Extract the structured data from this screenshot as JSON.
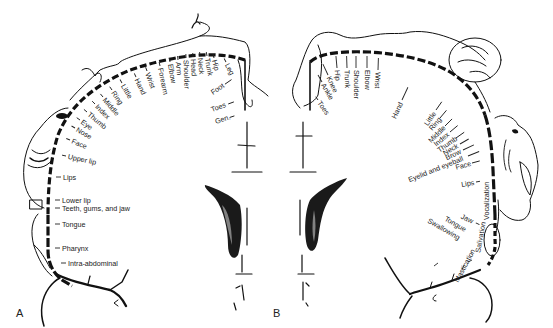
{
  "figure": {
    "panel_a_label": "A",
    "panel_b_label": "B",
    "colors": {
      "ink": "#111111",
      "background": "#ffffff",
      "label_text": "#222222"
    }
  },
  "sensory_homunculus_A": {
    "arc_labels": [
      {
        "text": "Leg"
      },
      {
        "text": "Hip"
      },
      {
        "text": "Trunk"
      },
      {
        "text": "Neck"
      },
      {
        "text": "Head"
      },
      {
        "text": "Shoulder"
      },
      {
        "text": "Arm"
      },
      {
        "text": "Elbow"
      },
      {
        "text": "Forearm"
      },
      {
        "text": "Wrist"
      },
      {
        "text": "Hand"
      },
      {
        "text": "Little"
      },
      {
        "text": "Ring"
      },
      {
        "text": "Middle"
      },
      {
        "text": "Index"
      },
      {
        "text": "Thumb"
      },
      {
        "text": "Eye"
      },
      {
        "text": "Nose"
      },
      {
        "text": "Face"
      },
      {
        "text": "Upper lip"
      }
    ],
    "vertical_labels": [
      {
        "text": "Lips"
      },
      {
        "text": "Lower lip"
      },
      {
        "text": "Teeth, gums, and jaw"
      },
      {
        "text": "Tongue"
      },
      {
        "text": "Pharynx"
      },
      {
        "text": "Intra-abdominal"
      }
    ],
    "medial_labels": [
      {
        "text": "Foot"
      },
      {
        "text": "Toes"
      },
      {
        "text": "Gen."
      }
    ]
  },
  "motor_homunculus_B": {
    "arc_labels": [
      {
        "text": "Toes"
      },
      {
        "text": "Ankle"
      },
      {
        "text": "Knee"
      },
      {
        "text": "Hip"
      },
      {
        "text": "Trunk"
      },
      {
        "text": "Shoulder"
      },
      {
        "text": "Elbow"
      },
      {
        "text": "Wrist"
      },
      {
        "text": "Hand"
      },
      {
        "text": "Little"
      },
      {
        "text": "Ring"
      },
      {
        "text": "Middle"
      },
      {
        "text": "Index"
      },
      {
        "text": "Thumb"
      },
      {
        "text": "Neck"
      },
      {
        "text": "Brow"
      },
      {
        "text": "Eyelid and eyeball"
      },
      {
        "text": "Face"
      },
      {
        "text": "Lips"
      }
    ],
    "lower_labels": [
      {
        "text": "Jaw"
      },
      {
        "text": "Tongue"
      },
      {
        "text": "Swallowing"
      },
      {
        "text": "Mastication"
      },
      {
        "text": "Salivation"
      },
      {
        "text": "Vocalization"
      }
    ]
  }
}
